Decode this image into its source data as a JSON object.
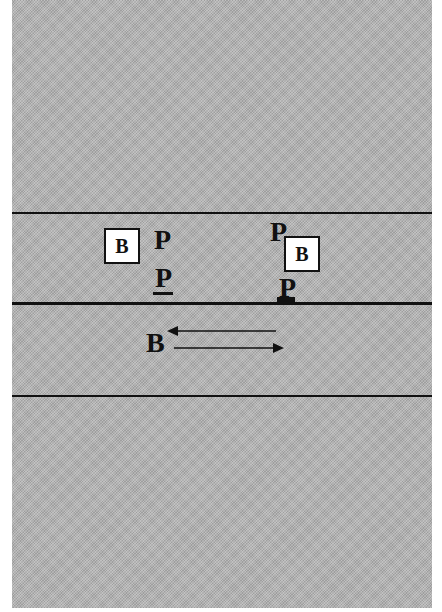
{
  "diagram": {
    "colors": {
      "background_texture": "#b4b4b4",
      "lines": "#111111",
      "box_fill": "#ffffff"
    },
    "lines": [
      {
        "id": "top-boundary",
        "weight": "thin"
      },
      {
        "id": "center-line",
        "weight": "thick"
      },
      {
        "id": "bottom-boundary",
        "weight": "thin"
      }
    ],
    "left_group": {
      "box_label": "B",
      "pedestrian_top": "P",
      "pedestrian_bottom": "P"
    },
    "right_group": {
      "pedestrian_top": "P",
      "box_label": "B",
      "pedestrian_bottom": "P"
    },
    "traffic": {
      "label": "B",
      "arrow_upper": "left",
      "arrow_lower": "right"
    }
  }
}
